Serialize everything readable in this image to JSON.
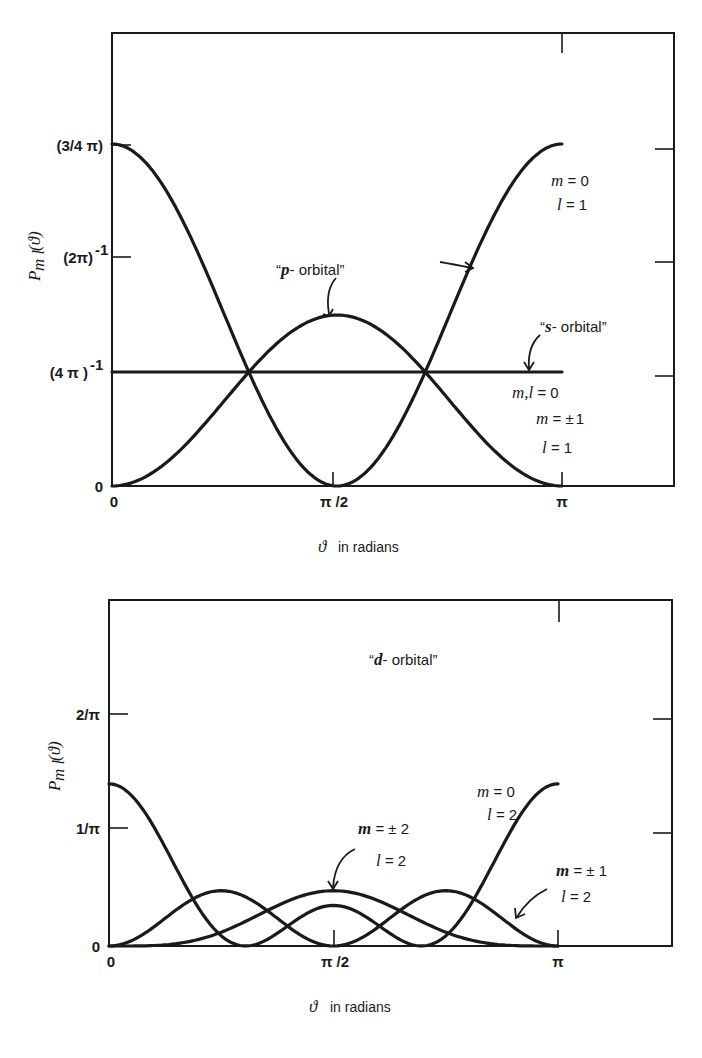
{
  "chart_data": [
    {
      "type": "line",
      "title": "",
      "xlabel": "ϑ in radians",
      "ylabel": "P_ml (ϑ)",
      "x_ticks": [
        "0",
        "π/2",
        "π"
      ],
      "y_ticks": [
        "0",
        "(4π)⁻¹",
        "(2π)⁻¹",
        "(3/4π)"
      ],
      "y_tick_values": [
        0,
        0.0796,
        0.1592,
        0.2387
      ],
      "xlim": [
        0,
        3.1416
      ],
      "ylim": [
        0,
        0.34
      ],
      "grid": false,
      "series": [
        {
          "name": "m,l = 0 (s-orbital)",
          "formula": "1/(4π)",
          "values_at": {
            "0": 0.0796,
            "π/2": 0.0796,
            "π": 0.0796
          }
        },
        {
          "name": "m = 0, l = 1 (p-orbital)",
          "formula": "(3/4π)cos²ϑ",
          "values_at": {
            "0": 0.2387,
            "π/2": 0,
            "π": 0.2387
          }
        },
        {
          "name": "m = ±1, l = 1",
          "formula": "(3/8π)sin²ϑ",
          "values_at": {
            "0": 0,
            "π/2": 0.1194,
            "π": 0
          }
        }
      ],
      "annotations": [
        "“p- orbital”",
        "“s- orbital”",
        "m = 0",
        "l = 1",
        "m,l = 0",
        "m = ± 1",
        "l = 1"
      ]
    },
    {
      "type": "line",
      "title": "",
      "xlabel": "ϑ in radians",
      "ylabel": "P_ml (ϑ)",
      "x_ticks": [
        "0",
        "π/2",
        "π"
      ],
      "y_ticks": [
        "0",
        "1/π",
        "2/π"
      ],
      "y_tick_values": [
        0,
        0.3183,
        0.6366
      ],
      "xlim": [
        0,
        3.1416
      ],
      "ylim": [
        0,
        0.86
      ],
      "grid": false,
      "series": [
        {
          "name": "m = 0, l = 2",
          "formula": "(5/16π)(3cos²ϑ−1)²",
          "values_at": {
            "0": 0.398,
            "π/2": 0.0995,
            "π": 0.398
          }
        },
        {
          "name": "m = ±1, l = 2",
          "formula": "(15/8π)sin²ϑcos²ϑ",
          "values_at": {
            "π/4": 0.149,
            "3π/4": 0.149
          }
        },
        {
          "name": "m = ±2, l = 2",
          "formula": "(15/32π)sin⁴ϑ",
          "values_at": {
            "0": 0,
            "π/2": 0.149,
            "π": 0
          }
        }
      ],
      "annotations": [
        "“d- orbital”",
        "m = 0",
        "l = 2",
        "m = ± 2",
        "l = 2",
        "m = ± 1",
        "l = 2"
      ]
    }
  ],
  "top": {
    "ylabel_main": "P",
    "ylabel_sub": "m l",
    "ylabel_arg": "(ϑ)",
    "y_ticks": {
      "t0": "0",
      "t1": "(4 π )",
      "t1_exp": "-1",
      "t2": "(2π)",
      "t2_exp": "-1",
      "t3": "(3/4 π)"
    },
    "x_ticks": {
      "x0": "0",
      "x1": "π /2",
      "x2": "π"
    },
    "xlabel_sym": "ϑ",
    "xlabel_text": "in radians",
    "ann": {
      "p_orbital_q": "“",
      "p_orbital_sym": "p",
      "p_orbital_rest": "- orbital”",
      "s_orbital_q": "“",
      "s_orbital_sym": "s",
      "s_orbital_rest": "- orbital”",
      "m0_m": "m",
      "m0_eq": " = 0",
      "l1_l": "l",
      "l1_eq": " = 1",
      "ml0_ml": "m,l",
      "ml0_eq": " = 0",
      "m1_m": "m",
      "m1_eq": " = ",
      "m1_pm": "±",
      "m1_val": "1",
      "l1b_l": "l",
      "l1b_eq": " = 1"
    }
  },
  "bottom": {
    "ylabel_main": "P",
    "ylabel_sub": "m l",
    "ylabel_arg": "(ϑ)",
    "y_ticks": {
      "t0": "0",
      "t1": "1/π",
      "t2": "2/π"
    },
    "x_ticks": {
      "x0": "0",
      "x1": "π /2",
      "x2": "π"
    },
    "xlabel_sym": "ϑ",
    "xlabel_text": "in radians",
    "ann": {
      "d_orbital_q": "“",
      "d_orbital_sym": "d",
      "d_orbital_rest": "- orbital”",
      "m0_m": "m",
      "m0_eq": " = 0",
      "l2a_l": "l",
      "l2a_eq": " = 2",
      "m2_m": "m",
      "m2_eq": " = ",
      "m2_pm": "±",
      "m2_val": " 2",
      "l2b_l": "l",
      "l2b_eq": " = 2",
      "m1_m": "m",
      "m1_eq": " = ",
      "m1_pm": "±",
      "m1_val": " 1",
      "l2c_l": "l",
      "l2c_eq": " = 2"
    }
  }
}
